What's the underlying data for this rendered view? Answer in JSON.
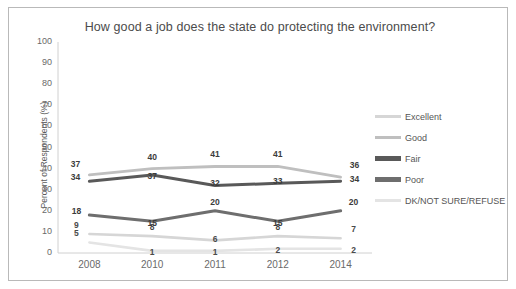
{
  "chart_data": {
    "type": "line",
    "title": "How good a job does the state do protecting the environment?",
    "xlabel": "",
    "ylabel": "Percent of Respondents (%)",
    "categories": [
      "2008",
      "2010",
      "2011",
      "2012",
      "2014"
    ],
    "ylim": [
      0,
      100
    ],
    "yticks": [
      "100",
      "90",
      "80",
      "70",
      "60",
      "50",
      "40",
      "30",
      "20",
      "10",
      "0"
    ],
    "grid": false,
    "legend_position": "right",
    "series": [
      {
        "name": "Excellent",
        "values": [
          9,
          8,
          6,
          8,
          7
        ],
        "color": "#d6d6d6"
      },
      {
        "name": "Good",
        "values": [
          37,
          40,
          41,
          41,
          36
        ],
        "color": "#bfbfbf"
      },
      {
        "name": "Fair",
        "values": [
          34,
          37,
          32,
          33,
          34
        ],
        "color": "#595959"
      },
      {
        "name": "Poor",
        "values": [
          18,
          15,
          20,
          15,
          20
        ],
        "color": "#6e6e6e"
      },
      {
        "name": "DK/NOT SURE/REFUSE",
        "values": [
          5,
          1,
          1,
          2,
          2
        ],
        "color": "#e4e4e4"
      }
    ]
  },
  "legend": {
    "items": [
      {
        "label": "Excellent"
      },
      {
        "label": "Good"
      },
      {
        "label": "Fair"
      },
      {
        "label": "Poor"
      },
      {
        "label": "DK/NOT SURE/REFUSE"
      }
    ]
  },
  "colors": {
    "frame_border": "#b9b9b9",
    "axis": "#d0d0d0",
    "title_text": "#4b4b4b",
    "tick_text": "#6a6a6a"
  }
}
